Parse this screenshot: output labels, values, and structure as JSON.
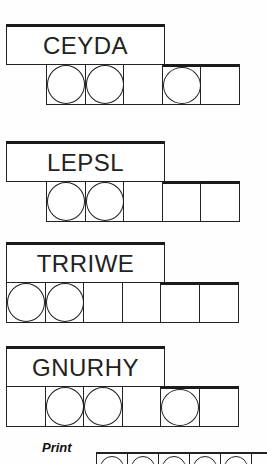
{
  "puzzles": [
    {
      "word": "CEYDA",
      "top": 24,
      "cells_left": 46,
      "cell_count": 5,
      "circled": [
        0,
        1,
        3
      ]
    },
    {
      "word": "LEPSL",
      "top": 141,
      "cells_left": 46,
      "cell_count": 5,
      "circled": [
        0,
        1
      ]
    },
    {
      "word": "TRRIWE",
      "top": 242,
      "cells_left": 6,
      "cell_count": 6,
      "circled": [
        0,
        1
      ]
    },
    {
      "word": "GNURHY",
      "top": 346,
      "cells_left": 6,
      "cell_count": 6,
      "circled": [
        1,
        2,
        4
      ]
    }
  ],
  "print_label": "Print",
  "answer_circles": 5
}
